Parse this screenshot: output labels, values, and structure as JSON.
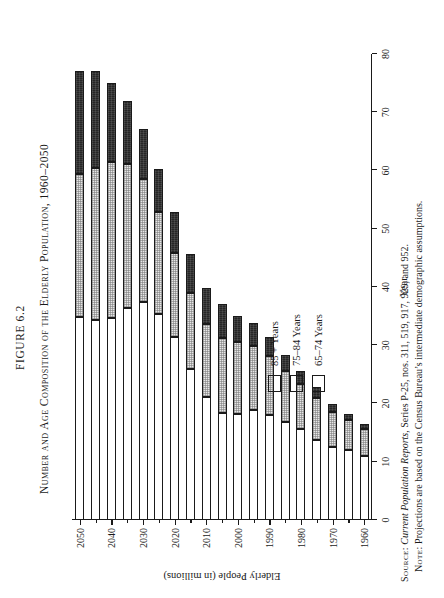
{
  "figure": {
    "label": "FIGURE 6.2",
    "title": "Number and Age Composition of the Elderly Population, 1960–2050"
  },
  "axes": {
    "x_title": "Year",
    "y_title": "Elderly People (in millions)",
    "y_ticks": [
      "80",
      "70",
      "60",
      "50",
      "40",
      "30",
      "20",
      "10",
      "0"
    ],
    "x_ticks": [
      "1960",
      "1970",
      "1980",
      "1990",
      "2000",
      "2010",
      "2020",
      "2030",
      "2040",
      "2050"
    ]
  },
  "legend": {
    "items": [
      {
        "label": "85 + Years",
        "swatch": "dark",
        "color": "#3a3a3a"
      },
      {
        "label": "75–84 Years",
        "swatch": "stipple",
        "color": "#e6e6e6"
      },
      {
        "label": "65–74 Years",
        "swatch": "white",
        "color": "#ffffff"
      }
    ]
  },
  "notes": {
    "source_label": "Source:",
    "source_text_italic": "Current Population Reports,",
    "source_text_rest": " Series P-25, nos. 311, 519, 917, 929, and 952.",
    "note_label": "Note:",
    "note_text": " Projections are based on the Census Bureau’s intermediate demographic assumptions."
  },
  "chart_data": {
    "type": "bar",
    "orientation": "horizontal-stacked",
    "title": "Number and Age Composition of the Elderly Population, 1960–2050",
    "xlabel": "Year",
    "ylabel": "Elderly People (in millions)",
    "ylim": [
      0,
      80
    ],
    "grid": false,
    "legend_position": "upper-left-inside",
    "categories": [
      "1960",
      "1965",
      "1970",
      "1975",
      "1980",
      "1985",
      "1990",
      "1995",
      "2000",
      "2005",
      "2010",
      "2015",
      "2020",
      "2025",
      "2030",
      "2035",
      "2040",
      "2045",
      "2050"
    ],
    "series": [
      {
        "name": "65–74 Years",
        "values": [
          11.0,
          12.0,
          12.5,
          13.7,
          15.6,
          16.8,
          18.1,
          18.8,
          18.2,
          18.4,
          21.1,
          26.0,
          31.4,
          35.4,
          37.4,
          36.4,
          34.7,
          34.4,
          34.9
        ]
      },
      {
        "name": "75–84 Years",
        "values": [
          4.6,
          5.1,
          6.1,
          7.3,
          7.7,
          8.8,
          10.0,
          11.1,
          12.3,
          12.9,
          12.6,
          13.0,
          14.5,
          17.4,
          21.2,
          24.8,
          26.8,
          26.1,
          24.5
        ]
      },
      {
        "name": "85 + Years",
        "values": [
          0.9,
          1.1,
          1.4,
          1.9,
          2.3,
          2.7,
          3.3,
          3.9,
          4.6,
          5.7,
          6.1,
          6.6,
          7.0,
          7.4,
          8.6,
          10.8,
          13.6,
          16.5,
          17.6
        ]
      }
    ],
    "totals": [
      16.5,
      18.2,
      20.0,
      22.9,
      25.6,
      28.3,
      31.4,
      33.8,
      35.1,
      37.0,
      39.8,
      45.6,
      52.9,
      60.2,
      67.2,
      72.0,
      75.1,
      77.0,
      77.0
    ]
  }
}
